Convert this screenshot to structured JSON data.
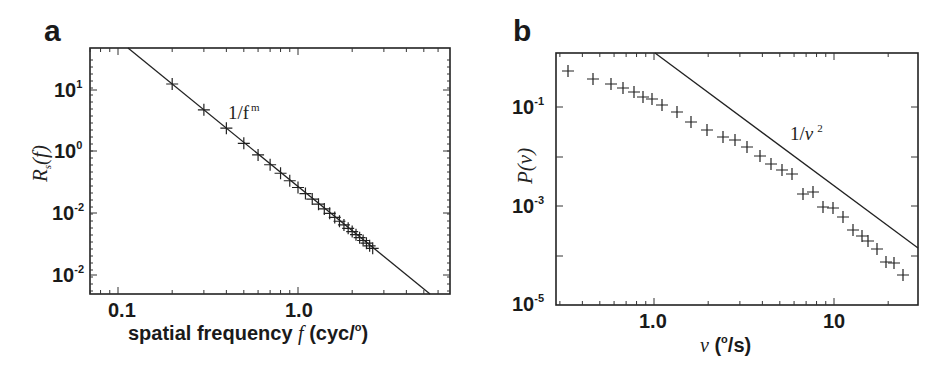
{
  "panels": [
    {
      "letter": "a"
    },
    {
      "letter": "b"
    }
  ],
  "chart_data": [
    {
      "type": "scatter",
      "panel": "a",
      "title": "",
      "xlabel": "spatial frequency f (cyc/°)",
      "ylabel": "R_s(f)",
      "xscale": "log",
      "yscale": "log",
      "xlim": [
        0.069,
        6.8
      ],
      "x_ticks": [
        {
          "value": 0.1,
          "label": "0.1"
        },
        {
          "value": 1.0,
          "label": "1.0"
        }
      ],
      "y_ticks": [
        {
          "label": "10",
          "exp": "1"
        },
        {
          "label": "10",
          "exp": "0"
        },
        {
          "label": "10",
          "exp": "-2"
        },
        {
          "label": "10",
          "exp": "-2"
        }
      ],
      "annotation": {
        "text": "1/f",
        "sup": "m"
      },
      "fit_line": {
        "label": "1/f^m",
        "from": [
          0.113,
          "top"
        ],
        "to": [
          4.9,
          "bottom"
        ]
      },
      "series": [
        {
          "name": "measured",
          "marker": "+",
          "x": [
            0.2,
            0.3,
            0.4,
            0.5,
            0.6,
            0.7,
            0.8,
            0.9,
            1.0,
            1.1,
            1.2,
            1.3,
            1.4,
            1.5,
            1.6,
            1.7,
            1.8,
            1.9,
            2.0,
            2.1,
            2.2,
            2.3,
            2.4,
            2.5,
            2.6
          ],
          "y_rel_decades": [
            1.0,
            0.64,
            0.37,
            0.16,
            -0.06,
            -0.2,
            -0.33,
            -0.47,
            -0.56,
            -0.67,
            -0.77,
            -0.87,
            -0.97,
            -1.08,
            -1.16,
            -1.24,
            -1.31,
            -1.38,
            -1.43,
            -1.48,
            -1.53,
            -1.58,
            -1.61,
            -1.66,
            -1.71
          ]
        }
      ],
      "grid": false
    },
    {
      "type": "scatter",
      "panel": "b",
      "title": "",
      "xlabel": "ν (°/s)",
      "ylabel": "P(ν)",
      "xscale": "log",
      "yscale": "log",
      "xlim": [
        0.28,
        29
      ],
      "ylim": [
        1e-05,
        1.26
      ],
      "x_ticks": [
        {
          "value": 1.0,
          "label": "1.0"
        },
        {
          "value": 10,
          "label": "10"
        }
      ],
      "y_ticks": [
        {
          "value": 0.1,
          "label": "10",
          "exp": "-1"
        },
        {
          "value": 0.001,
          "label": "10",
          "exp": "-3"
        },
        {
          "value": 1e-05,
          "label": "10",
          "exp": "-5"
        }
      ],
      "annotation": {
        "text": "1/ν",
        "sup": "2"
      },
      "fit_line": {
        "label": "1/ν^2",
        "from": [
          1.0,
          1.0
        ],
        "to": [
          29,
          0.0012
        ]
      },
      "series": [
        {
          "name": "measured",
          "marker": "+",
          "x": [
            0.35,
            0.48,
            0.6,
            0.7,
            0.8,
            0.9,
            1.0,
            1.14,
            1.35,
            1.63,
            2.0,
            2.45,
            2.85,
            3.3,
            3.9,
            4.5,
            5.2,
            5.9,
            6.5,
            7.4,
            8.3,
            9.5,
            10.6,
            12.3,
            13.4,
            15.2,
            17.2,
            19.1,
            21.5
          ],
          "y": [
            0.45,
            0.3,
            0.24,
            0.2,
            0.17,
            0.14,
            0.125,
            0.095,
            0.07,
            0.045,
            0.03,
            0.022,
            0.019,
            0.015,
            0.0098,
            0.0067,
            0.005,
            0.0042,
            0.0014,
            0.0016,
            0.00083,
            0.00077,
            0.00051,
            0.00028,
            0.00021,
            0.00017,
            0.00012,
            6e-05,
            5.8e-05,
            3.1e-05
          ]
        }
      ],
      "grid": false
    }
  ]
}
